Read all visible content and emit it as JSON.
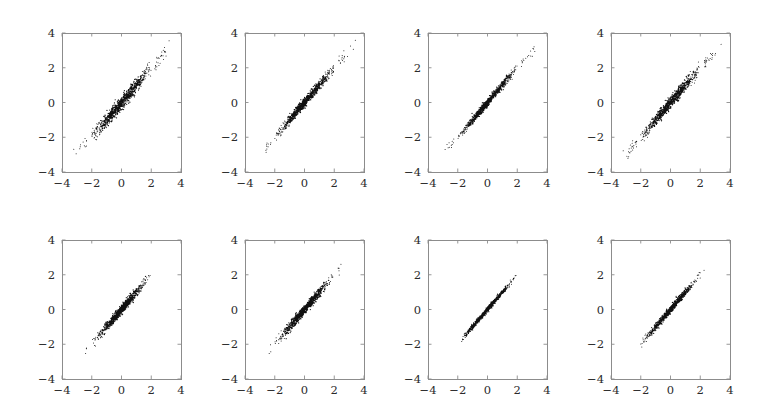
{
  "figure": {
    "name": "scatter-panel-grid",
    "width": 784,
    "height": 411,
    "background": "#ffffff",
    "rows": 2,
    "cols": 4,
    "point_color": "#101010",
    "axis_color": "#8c8c8c",
    "label_color": "#2a2a2a"
  },
  "axis": {
    "xlabel": "",
    "ylabel": "",
    "xlim": [
      -4,
      4
    ],
    "ylim": [
      -4,
      4
    ],
    "xticks": [
      -4,
      -2,
      0,
      2,
      4
    ],
    "yticks": [
      -4,
      -2,
      0,
      2,
      4
    ],
    "xticklabels": [
      "−4",
      "−2",
      "0",
      "2",
      "4"
    ],
    "yticklabels": [
      "−4",
      "−2",
      "0",
      "2",
      "4"
    ],
    "grid": false,
    "legend": false
  },
  "chart_data": {
    "type": "scatter",
    "title": "",
    "xlabel": "",
    "ylabel": "",
    "xlim": [
      -4,
      4
    ],
    "ylim": [
      -4,
      4
    ],
    "xticks": [
      -4,
      -2,
      0,
      2,
      4
    ],
    "yticks": [
      -4,
      -2,
      0,
      2,
      4
    ],
    "grid": false,
    "legend_position": "none",
    "panels": [
      {
        "index": 0,
        "row": 0,
        "col": 0,
        "label": "",
        "n_points": 900,
        "correlation": 0.985,
        "slope": 1.0,
        "intercept": 0.0,
        "x_spread_sd": 1.02,
        "residual_sd": 0.175,
        "x_range": [
          -3.6,
          3.4
        ],
        "y_range": [
          -3.5,
          3.5
        ],
        "seed": 11
      },
      {
        "index": 1,
        "row": 0,
        "col": 1,
        "label": "",
        "n_points": 900,
        "correlation": 0.992,
        "slope": 1.0,
        "intercept": 0.0,
        "x_spread_sd": 0.92,
        "residual_sd": 0.12,
        "x_range": [
          -3.2,
          3.6
        ],
        "y_range": [
          -3.2,
          3.6
        ],
        "seed": 22
      },
      {
        "index": 2,
        "row": 0,
        "col": 2,
        "label": "",
        "n_points": 900,
        "correlation": 0.994,
        "slope": 1.0,
        "intercept": 0.0,
        "x_spread_sd": 0.95,
        "residual_sd": 0.1,
        "x_range": [
          -3.6,
          3.9
        ],
        "y_range": [
          -3.6,
          3.9
        ],
        "seed": 33
      },
      {
        "index": 3,
        "row": 0,
        "col": 3,
        "label": "",
        "n_points": 900,
        "correlation": 0.988,
        "slope": 1.0,
        "intercept": 0.0,
        "x_spread_sd": 0.98,
        "residual_sd": 0.15,
        "x_range": [
          -3.5,
          3.6
        ],
        "y_range": [
          -3.5,
          3.5
        ],
        "seed": 44
      },
      {
        "index": 4,
        "row": 1,
        "col": 0,
        "label": "",
        "n_points": 900,
        "correlation": 0.99,
        "slope": 1.0,
        "intercept": 0.0,
        "x_spread_sd": 0.78,
        "residual_sd": 0.12,
        "x_range": [
          -2.5,
          2.3
        ],
        "y_range": [
          -2.5,
          2.3
        ],
        "seed": 55
      },
      {
        "index": 5,
        "row": 1,
        "col": 1,
        "label": "",
        "n_points": 900,
        "correlation": 0.991,
        "slope": 1.0,
        "intercept": 0.0,
        "x_spread_sd": 0.8,
        "residual_sd": 0.12,
        "x_range": [
          -2.4,
          2.5
        ],
        "y_range": [
          -2.4,
          2.5
        ],
        "seed": 66
      },
      {
        "index": 6,
        "row": 1,
        "col": 2,
        "label": "",
        "n_points": 900,
        "correlation": 0.996,
        "slope": 1.0,
        "intercept": 0.0,
        "x_spread_sd": 0.72,
        "residual_sd": 0.06,
        "x_range": [
          -2.2,
          2.3
        ],
        "y_range": [
          -2.2,
          2.3
        ],
        "seed": 77
      },
      {
        "index": 7,
        "row": 1,
        "col": 3,
        "label": "",
        "n_points": 900,
        "correlation": 0.993,
        "slope": 1.0,
        "intercept": 0.0,
        "x_spread_sd": 0.72,
        "residual_sd": 0.09,
        "x_range": [
          -2.3,
          2.3
        ],
        "y_range": [
          -2.3,
          2.3
        ],
        "seed": 88
      }
    ]
  },
  "layout": {
    "panel_left": [
      62,
      245,
      428,
      611
    ],
    "panel_top": [
      33,
      240
    ],
    "panel_width": 119,
    "panel_height": 139,
    "tick_len": 3.5
  }
}
